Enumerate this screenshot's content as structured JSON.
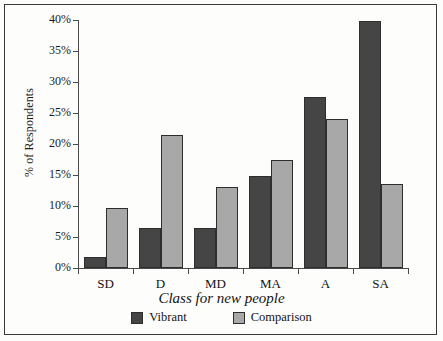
{
  "chart_data": {
    "type": "bar",
    "title": "",
    "subtitle": "",
    "xlabel": "Class for new people",
    "ylabel": "% of Respondents",
    "categories": [
      "SD",
      "D",
      "MD",
      "MA",
      "A",
      "SA"
    ],
    "series": [
      {
        "name": "Vibrant",
        "color": "#454545",
        "values": [
          1.8,
          6.5,
          6.5,
          14.9,
          27.6,
          39.9
        ]
      },
      {
        "name": "Comparison",
        "color": "#a8a8a8",
        "values": [
          9.7,
          21.5,
          13.0,
          17.4,
          24.1,
          13.5
        ]
      }
    ],
    "ylim": [
      0,
      40
    ],
    "ytick_values": [
      0,
      5,
      10,
      15,
      20,
      25,
      30,
      35,
      40
    ],
    "ytick_labels": [
      "0%",
      "5%",
      "10%",
      "15%",
      "20%",
      "25%",
      "30%",
      "35%",
      "40%"
    ],
    "grid": false,
    "legend_position": "bottom",
    "bar_outline_color": "#2e2e2e",
    "axis_color": "#4a4a4a",
    "background_color": "#fdfdfc",
    "frame_color": "#3a3a3a"
  },
  "legend": {
    "items": [
      {
        "label": "Vibrant",
        "color": "#454545"
      },
      {
        "label": "Comparison",
        "color": "#a8a8a8"
      }
    ]
  }
}
